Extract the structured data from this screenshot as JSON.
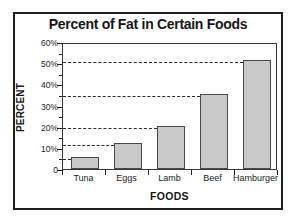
{
  "chart_data": {
    "type": "bar",
    "title": "Percent of Fat in Certain Foods",
    "xlabel": "FOODS",
    "ylabel": "PERCENT",
    "categories": [
      "Tuna",
      "Eggs",
      "Lamb",
      "Beef",
      "Hamburger"
    ],
    "values": [
      5.5,
      12.5,
      20.5,
      35.5,
      51.5
    ],
    "ylim": [
      0,
      60
    ],
    "ytick_labels": [
      "0",
      "10%",
      "20%",
      "30%",
      "40%",
      "50%",
      "60%"
    ],
    "ytick_values": [
      0,
      10,
      20,
      30,
      40,
      50,
      60
    ],
    "yminor_tick_values": [
      5,
      15,
      25,
      35,
      45,
      55
    ],
    "grid": "dashed horizontal gridlines drawn from y-axis to the top of each bar",
    "legend": "none",
    "bar_color": "#c9c9c9",
    "bar_edge_color": "#4a4a4a",
    "axis_color": "#1f1f1f",
    "background": "#ffffff"
  }
}
